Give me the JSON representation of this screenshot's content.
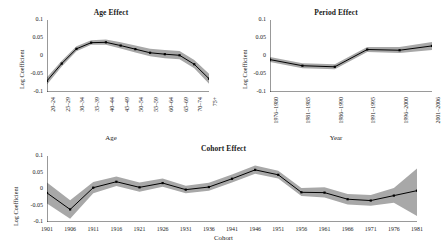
{
  "figure": {
    "ylabel": "Log Coefficient",
    "yticks": [
      "0.1",
      "0.05",
      "0",
      "-0.05",
      "-0.1"
    ],
    "ytick_values": [
      0.1,
      0.05,
      0,
      -0.05,
      -0.1
    ],
    "band_color": "#a8a8a8",
    "line_color": "#000000",
    "axis_color": "#000000"
  },
  "chart_data": [
    {
      "type": "line",
      "title": "Age Effect",
      "xlabel": "Age",
      "ylabel": "Log Coefficient",
      "ylim": [
        -0.1,
        0.1
      ],
      "grid": false,
      "legend": "none",
      "categories": [
        "20–24",
        "25–29",
        "30–34",
        "35–39",
        "40–44",
        "45–49",
        "50–54",
        "55–59",
        "60–64",
        "65–69",
        "70–74",
        "75+"
      ],
      "values": [
        -0.069,
        -0.021,
        0.02,
        0.037,
        0.038,
        0.029,
        0.019,
        0.009,
        0.005,
        0.002,
        -0.023,
        -0.063
      ],
      "band_lower": [
        -0.079,
        -0.029,
        0.013,
        0.031,
        0.031,
        0.021,
        0.01,
        -0.001,
        -0.006,
        -0.009,
        -0.034,
        -0.077
      ],
      "band_upper": [
        -0.059,
        -0.013,
        0.027,
        0.044,
        0.046,
        0.038,
        0.029,
        0.02,
        0.017,
        0.014,
        -0.011,
        -0.049
      ]
    },
    {
      "type": "line",
      "title": "Period Effect",
      "xlabel": "Year",
      "ylabel": "Log Coefficient",
      "ylim": [
        -0.1,
        0.1
      ],
      "grid": false,
      "legend": "none",
      "categories": [
        "1976–1980",
        "1981–1985",
        "1986–1990",
        "1991–1995",
        "1996–2000",
        "2001–2006"
      ],
      "values": [
        -0.01,
        -0.027,
        -0.03,
        0.018,
        0.016,
        0.028
      ],
      "band_lower": [
        -0.017,
        -0.034,
        -0.037,
        0.011,
        0.008,
        0.017
      ],
      "band_upper": [
        -0.003,
        -0.02,
        -0.023,
        0.025,
        0.025,
        0.039
      ]
    },
    {
      "type": "line",
      "title": "Cohort Effect",
      "xlabel": "Cohort",
      "ylabel": "Log Coefficient",
      "ylim": [
        -0.1,
        0.1
      ],
      "grid": false,
      "legend": "none",
      "categories": [
        "1901",
        "1906",
        "1911",
        "1916",
        "1921",
        "1926",
        "1931",
        "1936",
        "1941",
        "1946",
        "1951",
        "1956",
        "1961",
        "1966",
        "1971",
        "1976",
        "1981"
      ],
      "values": [
        -0.012,
        -0.062,
        0.004,
        0.022,
        0.005,
        0.018,
        -0.002,
        0.006,
        0.031,
        0.058,
        0.043,
        -0.01,
        -0.011,
        -0.031,
        -0.035,
        -0.02,
        -0.005
      ],
      "band_lower": [
        -0.044,
        -0.09,
        -0.013,
        0.009,
        -0.008,
        0.007,
        -0.013,
        -0.005,
        0.02,
        0.046,
        0.032,
        -0.021,
        -0.026,
        -0.047,
        -0.051,
        -0.042,
        -0.082
      ],
      "band_upper": [
        0.02,
        -0.034,
        0.021,
        0.038,
        0.02,
        0.032,
        0.01,
        0.019,
        0.044,
        0.071,
        0.055,
        0.003,
        0.005,
        -0.015,
        -0.018,
        0.003,
        0.062
      ]
    }
  ]
}
